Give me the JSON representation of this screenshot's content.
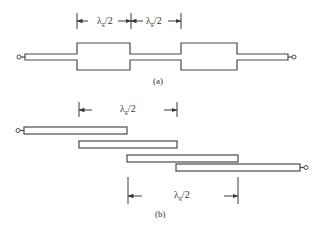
{
  "figure": {
    "part_a": {
      "caption": "(a)",
      "description": "Stepped-impedance half-wavelength resonator filter",
      "dimensions": [
        {
          "symbol": "λ",
          "subscript": "g",
          "suffix": "/2"
        },
        {
          "symbol": "λ",
          "subscript": "g",
          "suffix": "/2"
        }
      ],
      "resonator_count": 2
    },
    "part_b": {
      "caption": "(b)",
      "description": "Parallel-coupled half-wavelength line resonators",
      "dimensions": [
        {
          "symbol": "λ",
          "subscript": "g",
          "suffix": "/2"
        },
        {
          "symbol": "λ",
          "subscript": "g",
          "suffix": "/2"
        }
      ],
      "coupled_line_count": 4
    },
    "colors": {
      "line": "#4a4a4a",
      "text": "#333333",
      "background": "#ffffff"
    }
  }
}
